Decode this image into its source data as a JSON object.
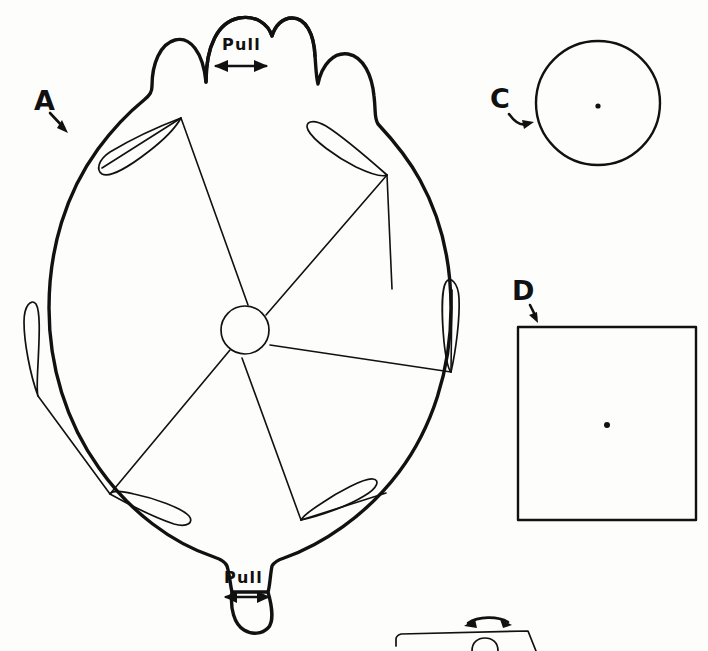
{
  "figure": {
    "background_color": "#fdfdfc",
    "ink_color": "#111111"
  },
  "labels": {
    "wheel": "A",
    "circle": "C",
    "square": "D"
  },
  "tabs": {
    "top_pull": "Pull",
    "bottom_pull": "Pull"
  },
  "parts": {
    "wheel": {
      "name": "A",
      "description": "Scalloped round wheel with five curved blade cuts and slots",
      "blade_count": 5,
      "slot_count": 5,
      "hub": "small center circle",
      "tab_count": 2
    },
    "circle": {
      "name": "C",
      "description": "Plain circle with center dot",
      "center_dot": true
    },
    "square": {
      "name": "D",
      "description": "Plain square with center dot",
      "center_dot": true
    },
    "partial_bottom": {
      "description": "Partially visible tilted rectangle with curved double arrow",
      "arrow": "curved double-headed"
    }
  },
  "annotations": {
    "a_arrow": "straight arrow pointing down-right to wheel rim",
    "c_arrow": "curved arrow pointing right to circle",
    "d_arrow": "short arrow pointing down to square",
    "top_pull_arrow": "horizontal double-headed arrow",
    "bottom_pull_arrow": "horizontal double-headed arrow",
    "bottom_curved_arrow": "curved double-headed arrow"
  }
}
